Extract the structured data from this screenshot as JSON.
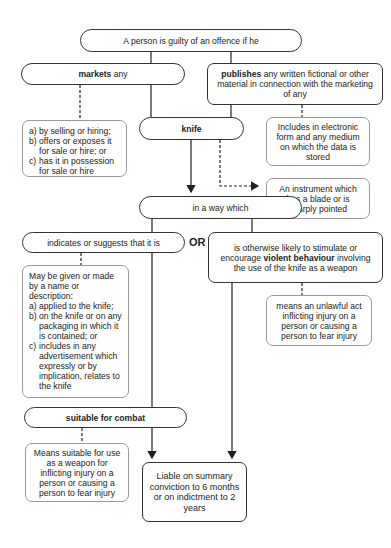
{
  "diagram": {
    "root": "A person is guilty of an offence if he",
    "markets": {
      "bold": "markets",
      "rest": " any"
    },
    "publishes": {
      "bold": "publishes",
      "rest": " any written fictional or other material in connection with the marketing of any"
    },
    "markets_detail": [
      {
        "marker": "a)",
        "text": "by selling or hiring;"
      },
      {
        "marker": "b)",
        "text": "offers or exposes it for sale or hire; or"
      },
      {
        "marker": "c)",
        "text": "has it in possession for sale or hire"
      }
    ],
    "knife": "knife",
    "includes_note": "Includes in electronic form and any medium on which the data is stored",
    "instrument_note": "An instrument which has a blade or is sharply pointed",
    "in_a_way": "in a way which",
    "indicates": "indicates or suggests that it is",
    "or_label": "OR",
    "otherwise": {
      "pre": "is otherwise likely to stimulate or encourage ",
      "bold": "violent behaviour",
      "post": " involving the use of the knife as a weapon"
    },
    "may_be_given": {
      "intro": "May be given or made by a name or description:",
      "items": [
        {
          "marker": "a)",
          "text": "applied to the knife;"
        },
        {
          "marker": "b)",
          "text": "on the knife or on any packaging in which it is contained; or"
        },
        {
          "marker": "c)",
          "text": "includes in any advertisement which expressly or by implication, relates to the knife"
        }
      ]
    },
    "unlawful_note": "means an unlawful act inflicting injury on a person or causing a person to fear injury",
    "suitable": "suitable for combat",
    "suitable_note": "Means suitable for use as a weapon for inflicting injury on a person or causing a person to fear injury",
    "penalty": "Liable on summary conviction to 6 months or on indictment to 2 years"
  }
}
